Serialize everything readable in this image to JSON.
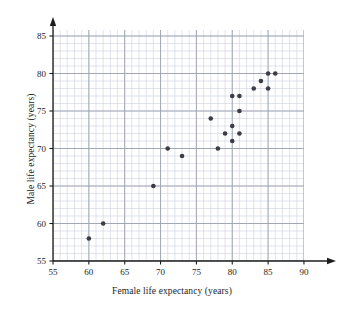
{
  "chart_data": {
    "type": "scatter",
    "title": "",
    "xlabel": "Female life expectancy (years)",
    "ylabel": "Male life expectancy (years)",
    "xlim": [
      55,
      92
    ],
    "ylim": [
      55,
      87
    ],
    "xticks": [
      55,
      60,
      65,
      70,
      75,
      80,
      85,
      90
    ],
    "yticks": [
      55,
      60,
      65,
      70,
      75,
      80,
      85
    ],
    "xtick_labels": [
      "55",
      "60",
      "65",
      "70",
      "75",
      "80",
      "85",
      "90"
    ],
    "ytick_labels": [
      "55",
      "60",
      "65",
      "70",
      "75",
      "80",
      "85"
    ],
    "grid": true,
    "minor_grid": true,
    "minor_grid_step": 1,
    "major_grid_step": 5,
    "legend": null,
    "marker": "filled-circle",
    "marker_color": "#3c3c46",
    "grid_major_color": "#9aa0b0",
    "grid_minor_color": "#ccd2e0",
    "axis_color": "#1c1c1c",
    "points": [
      {
        "x": 60,
        "y": 58
      },
      {
        "x": 62,
        "y": 60
      },
      {
        "x": 69,
        "y": 65
      },
      {
        "x": 71,
        "y": 70
      },
      {
        "x": 73,
        "y": 69
      },
      {
        "x": 77,
        "y": 74
      },
      {
        "x": 78,
        "y": 70
      },
      {
        "x": 79,
        "y": 72
      },
      {
        "x": 80,
        "y": 73
      },
      {
        "x": 80,
        "y": 71
      },
      {
        "x": 80,
        "y": 77
      },
      {
        "x": 81,
        "y": 77
      },
      {
        "x": 81,
        "y": 75
      },
      {
        "x": 81,
        "y": 72
      },
      {
        "x": 83,
        "y": 78
      },
      {
        "x": 84,
        "y": 79
      },
      {
        "x": 85,
        "y": 80
      },
      {
        "x": 85,
        "y": 78
      },
      {
        "x": 86,
        "y": 80
      }
    ]
  }
}
